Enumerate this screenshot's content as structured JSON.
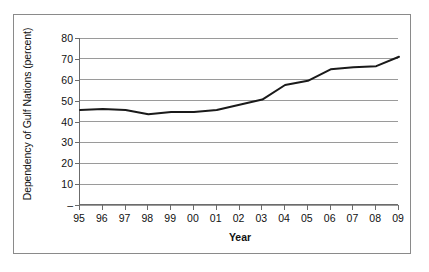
{
  "chart_data": {
    "type": "line",
    "title": "",
    "xlabel": "Year",
    "ylabel": "Dependency of Gulf Nations (percent)",
    "categories": [
      "95",
      "96",
      "97",
      "98",
      "99",
      "00",
      "01",
      "02",
      "03",
      "04",
      "05",
      "06",
      "07",
      "08",
      "09"
    ],
    "x": [
      1995,
      1996,
      1997,
      1998,
      1999,
      2000,
      2001,
      2002,
      2003,
      2004,
      2005,
      2006,
      2007,
      2008,
      2009
    ],
    "values": [
      45.5,
      46.0,
      45.5,
      43.5,
      44.5,
      44.5,
      45.5,
      48.0,
      50.5,
      57.5,
      59.5,
      65.0,
      66.0,
      66.5,
      71.0
    ],
    "series": [
      {
        "name": "Dependency of Gulf Nations",
        "values": [
          45.5,
          46.0,
          45.5,
          43.5,
          44.5,
          44.5,
          45.5,
          48.0,
          50.5,
          57.5,
          59.5,
          65.0,
          66.0,
          66.5,
          71.0
        ],
        "color": "#1a1a1a"
      }
    ],
    "ylim": [
      0,
      80
    ],
    "yticks": [
      0,
      10,
      20,
      30,
      40,
      50,
      60,
      70,
      80
    ],
    "ytick_labels": [
      "–",
      "10",
      "20",
      "30",
      "40",
      "50",
      "60",
      "70",
      "80"
    ],
    "xlim": [
      1995,
      2009
    ],
    "grid": true,
    "grid_axis": "y",
    "legend": false,
    "legend_position": "none",
    "line_color": "#1a1a1a",
    "line_width": 2,
    "markers": false,
    "background_color": "#ffffff",
    "axis_color": "#6b6b6b",
    "gridline_color": "#9a9a9a"
  },
  "figure": {
    "frame_color": "#8a8a8a"
  }
}
